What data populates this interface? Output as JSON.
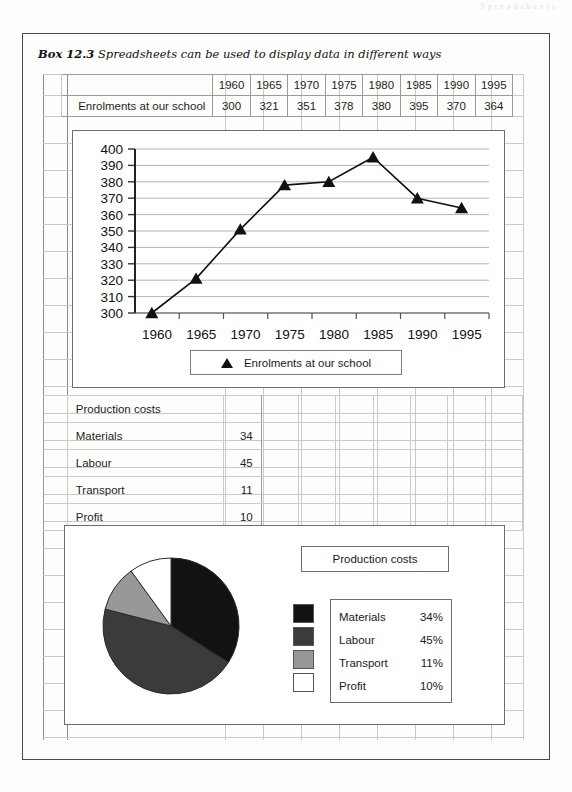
{
  "page": {
    "ghost_header": "Spreadsheets"
  },
  "box": {
    "number": "Box 12.3",
    "caption": "Spreadsheets can be used to display data in different ways"
  },
  "enrolment_table": {
    "row_label": "Enrolments at our school",
    "years": [
      "1960",
      "1965",
      "1970",
      "1975",
      "1980",
      "1985",
      "1990",
      "1995"
    ],
    "values": [
      "300",
      "321",
      "351",
      "378",
      "380",
      "395",
      "370",
      "364"
    ]
  },
  "line_legend": {
    "marker": "triangle-marker",
    "label": "Enrolments at our school"
  },
  "cost_table": {
    "title": "Production costs",
    "rows": [
      {
        "name": "Materials",
        "value": "34"
      },
      {
        "name": "Labour",
        "value": "45"
      },
      {
        "name": "Transport",
        "value": "11"
      },
      {
        "name": "Profit",
        "value": "10"
      }
    ]
  },
  "pie": {
    "title": "Production costs",
    "legend": [
      {
        "label": "Materials",
        "pct": "34%",
        "color": "#121212"
      },
      {
        "label": "Labour",
        "pct": "45%",
        "color": "#3b3b3b"
      },
      {
        "label": "Transport",
        "pct": "11%",
        "color": "#989898"
      },
      {
        "label": "Profit",
        "pct": "10%",
        "color": "#ffffff"
      }
    ]
  },
  "chart_data": [
    {
      "type": "line",
      "title": "",
      "xlabel": "",
      "ylabel": "",
      "categories": [
        "1960",
        "1965",
        "1970",
        "1975",
        "1980",
        "1985",
        "1990",
        "1995"
      ],
      "series": [
        {
          "name": "Enrolments at our school",
          "values": [
            300,
            321,
            351,
            378,
            380,
            395,
            370,
            364
          ],
          "marker": "triangle",
          "color": "#111111"
        }
      ],
      "ylim": [
        300,
        400
      ],
      "ytick_step": 10,
      "yticks": [
        300,
        310,
        320,
        330,
        340,
        350,
        360,
        370,
        380,
        390,
        400
      ],
      "grid": true,
      "legend_position": "below"
    },
    {
      "type": "pie",
      "title": "Production costs",
      "categories": [
        "Materials",
        "Labour",
        "Transport",
        "Profit"
      ],
      "values": [
        34,
        45,
        11,
        10
      ],
      "labels": [
        "34%",
        "45%",
        "11%",
        "10%"
      ],
      "colors": [
        "#121212",
        "#3b3b3b",
        "#989898",
        "#ffffff"
      ],
      "legend_position": "right"
    },
    {
      "type": "table",
      "title": "Enrolments at our school",
      "columns": [
        "1960",
        "1965",
        "1970",
        "1975",
        "1980",
        "1985",
        "1990",
        "1995"
      ],
      "rows": [
        [
          "300",
          "321",
          "351",
          "378",
          "380",
          "395",
          "370",
          "364"
        ]
      ]
    }
  ]
}
